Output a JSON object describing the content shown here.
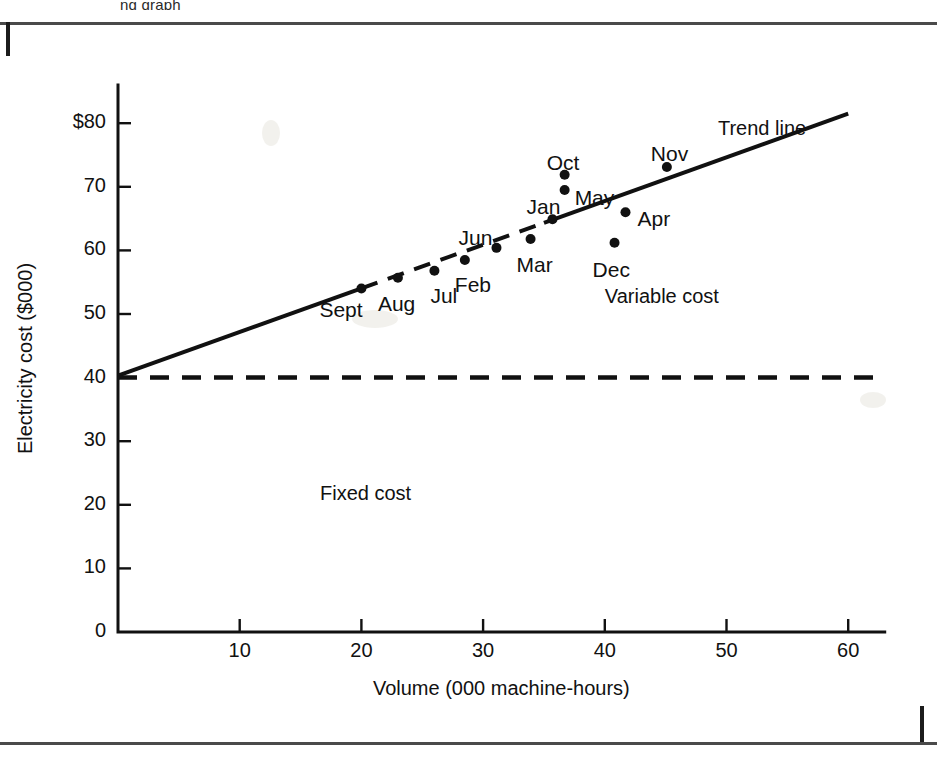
{
  "page": {
    "bleed_caption": "ng graph",
    "background": "#ffffff",
    "ink_color": "#111111"
  },
  "chart_data": {
    "type": "scatter",
    "title": "",
    "subtitle": "",
    "xlabel": "Volume (000 machine-hours)",
    "ylabel": "Electricity cost ($000)",
    "xlim": [
      0,
      63
    ],
    "ylim": [
      0,
      86
    ],
    "grid": false,
    "legend_position": "none",
    "x_ticks": [
      {
        "value": 10,
        "label": "10"
      },
      {
        "value": 20,
        "label": "20"
      },
      {
        "value": 30,
        "label": "30"
      },
      {
        "value": 40,
        "label": "40"
      },
      {
        "value": 50,
        "label": "50"
      },
      {
        "value": 60,
        "label": "60"
      }
    ],
    "y_ticks": [
      {
        "value": 0,
        "label": "0"
      },
      {
        "value": 10,
        "label": "10"
      },
      {
        "value": 20,
        "label": "20"
      },
      {
        "value": 30,
        "label": "30"
      },
      {
        "value": 40,
        "label": "40"
      },
      {
        "value": 50,
        "label": "50"
      },
      {
        "value": 60,
        "label": "60"
      },
      {
        "value": 70,
        "label": "70"
      },
      {
        "value": 80,
        "label": "$80"
      }
    ],
    "points": [
      {
        "label": "Sept",
        "x": 20.0,
        "y": 54.0,
        "label_dx": -42,
        "label_dy": 21
      },
      {
        "label": "Aug",
        "x": 23.0,
        "y": 55.7,
        "label_dx": -20,
        "label_dy": 26
      },
      {
        "label": "Jul",
        "x": 26.0,
        "y": 56.8,
        "label_dx": -4,
        "label_dy": 25
      },
      {
        "label": "Feb",
        "x": 28.5,
        "y": 58.5,
        "label_dx": -10,
        "label_dy": 25
      },
      {
        "label": "Jun",
        "x": 31.1,
        "y": 60.4,
        "label_dx": -38,
        "label_dy": -10
      },
      {
        "label": "Mar",
        "x": 33.9,
        "y": 61.8,
        "label_dx": -14,
        "label_dy": 26
      },
      {
        "label": "Jan",
        "x": 35.7,
        "y": 64.9,
        "label_dx": -26,
        "label_dy": -12
      },
      {
        "label": "May",
        "x": 36.7,
        "y": 69.5,
        "label_dx": 10,
        "label_dy": 8
      },
      {
        "label": "Oct",
        "x": 36.7,
        "y": 71.9,
        "label_dx": -18,
        "label_dy": -12
      },
      {
        "label": "Dec",
        "x": 40.8,
        "y": 61.2,
        "label_dx": -22,
        "label_dy": 27
      },
      {
        "label": "Apr",
        "x": 41.7,
        "y": 66.0,
        "label_dx": 12,
        "label_dy": 7
      },
      {
        "label": "Nov",
        "x": 45.1,
        "y": 73.1,
        "label_dx": -16,
        "label_dy": -13
      }
    ],
    "lines": [
      {
        "name": "trend-line",
        "style": "solid-with-dashed-middle",
        "x0": 0.0,
        "y0": 40.3,
        "x1": 60.0,
        "y1": 81.5,
        "dashed_from_x": 20.0,
        "dashed_to_x": 35.0
      },
      {
        "name": "fixed-cost-line",
        "style": "dashed",
        "x0": 0.0,
        "y0": 40.0,
        "x1": 62.8,
        "y1": 40.0
      }
    ],
    "annotations": [
      {
        "name": "trend-line-label",
        "text": "Trend line",
        "x": 49.3,
        "y": 79.0
      },
      {
        "name": "variable-cost-label",
        "text": "Variable cost",
        "x": 40.0,
        "y": 52.5
      },
      {
        "name": "fixed-cost-label",
        "text": "Fixed cost",
        "x": 16.6,
        "y": 21.5
      }
    ]
  }
}
